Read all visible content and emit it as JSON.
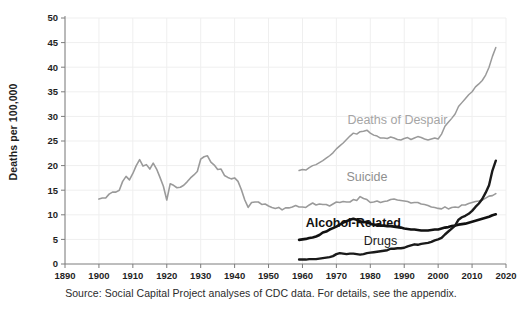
{
  "chart_data": {
    "type": "line",
    "title": "",
    "xlabel": "",
    "ylabel": "Deaths per 100,000",
    "xlim": [
      1890,
      2020
    ],
    "ylim": [
      0,
      50
    ],
    "grid": true,
    "legend_position": "inline-annotations",
    "xticks": [
      "1890",
      "1900",
      "1910",
      "1920",
      "1930",
      "1940",
      "1950",
      "1960",
      "1970",
      "1980",
      "1990",
      "2000",
      "2010",
      "2020"
    ],
    "yticks": [
      "0",
      "5",
      "10",
      "15",
      "20",
      "25",
      "30",
      "35",
      "40",
      "45",
      "50"
    ],
    "colors": {
      "deaths_of_despair": "#9a9a9a",
      "suicide": "#9a9a9a",
      "alcohol_related": "#111111",
      "drugs": "#1a1a1a",
      "axis": "#7c7c7c",
      "grid": "#efefef",
      "text": "#2b2b2b"
    },
    "series": [
      {
        "name": "Deaths of Despair",
        "color": "#9a9a9a",
        "label_x": 1988,
        "label_y": 28.5,
        "x": [
          1959,
          1960,
          1961,
          1962,
          1963,
          1964,
          1965,
          1966,
          1967,
          1968,
          1969,
          1970,
          1971,
          1972,
          1973,
          1974,
          1975,
          1976,
          1977,
          1978,
          1979,
          1980,
          1981,
          1982,
          1983,
          1984,
          1985,
          1986,
          1987,
          1988,
          1989,
          1990,
          1991,
          1992,
          1993,
          1994,
          1995,
          1996,
          1997,
          1998,
          1999,
          2000,
          2001,
          2002,
          2003,
          2004,
          2005,
          2006,
          2007,
          2008,
          2009,
          2010,
          2011,
          2012,
          2013,
          2014,
          2015,
          2016,
          2017
        ],
        "y": [
          19.0,
          19.2,
          19.1,
          19.6,
          20.0,
          20.2,
          20.6,
          21.0,
          21.5,
          22.0,
          22.6,
          23.4,
          24.0,
          24.6,
          25.3,
          26.0,
          26.6,
          26.4,
          26.9,
          27.0,
          27.2,
          26.6,
          26.2,
          26.0,
          25.6,
          25.6,
          25.5,
          25.8,
          25.6,
          25.3,
          25.2,
          25.5,
          25.7,
          25.3,
          25.6,
          25.9,
          25.7,
          25.4,
          25.2,
          25.4,
          25.6,
          25.4,
          26.4,
          28.0,
          28.8,
          29.6,
          30.5,
          32.0,
          32.8,
          33.6,
          34.4,
          35.0,
          36.0,
          36.6,
          37.3,
          38.4,
          40.0,
          42.2,
          44.0
        ]
      },
      {
        "name": "Suicide",
        "color": "#9a9a9a",
        "label_x": 1979,
        "label_y": 16.8,
        "x": [
          1900,
          1901,
          1902,
          1903,
          1904,
          1905,
          1906,
          1907,
          1908,
          1909,
          1910,
          1911,
          1912,
          1913,
          1914,
          1915,
          1916,
          1917,
          1918,
          1919,
          1920,
          1921,
          1922,
          1923,
          1924,
          1925,
          1926,
          1927,
          1928,
          1929,
          1930,
          1931,
          1932,
          1933,
          1934,
          1935,
          1936,
          1937,
          1938,
          1939,
          1940,
          1941,
          1942,
          1943,
          1944,
          1945,
          1946,
          1947,
          1948,
          1949,
          1950,
          1951,
          1952,
          1953,
          1954,
          1955,
          1956,
          1957,
          1958,
          1959,
          1960,
          1961,
          1962,
          1963,
          1964,
          1965,
          1966,
          1967,
          1968,
          1969,
          1970,
          1971,
          1972,
          1973,
          1974,
          1975,
          1976,
          1977,
          1978,
          1979,
          1980,
          1981,
          1982,
          1983,
          1984,
          1985,
          1986,
          1987,
          1988,
          1989,
          1990,
          1991,
          1992,
          1993,
          1994,
          1995,
          1996,
          1997,
          1998,
          1999,
          2000,
          2001,
          2002,
          2003,
          2004,
          2005,
          2006,
          2007,
          2008,
          2009,
          2010,
          2011,
          2012,
          2013,
          2014,
          2015,
          2016,
          2017
        ],
        "y": [
          13.2,
          13.4,
          13.4,
          14.2,
          14.6,
          14.6,
          15.0,
          16.8,
          17.8,
          17.1,
          18.4,
          20.0,
          21.2,
          19.9,
          20.2,
          19.3,
          20.5,
          19.3,
          17.6,
          15.8,
          13.0,
          16.3,
          16.0,
          15.5,
          15.6,
          16.0,
          16.7,
          17.5,
          18.1,
          18.8,
          21.3,
          21.8,
          22.0,
          20.7,
          20.1,
          19.2,
          19.3,
          18.0,
          17.6,
          17.3,
          17.5,
          16.8,
          15.1,
          13.0,
          11.5,
          12.5,
          12.6,
          12.6,
          12.1,
          12.2,
          11.8,
          11.5,
          11.3,
          11.5,
          11.0,
          11.4,
          11.4,
          11.6,
          11.9,
          11.6,
          11.6,
          11.5,
          12.0,
          12.4,
          12.0,
          12.2,
          12.1,
          12.1,
          11.8,
          12.2,
          12.6,
          12.5,
          12.7,
          12.6,
          12.6,
          13.1,
          12.9,
          13.7,
          13.3,
          13.1,
          12.5,
          12.6,
          12.8,
          12.5,
          12.7,
          12.8,
          13.1,
          13.2,
          13.0,
          12.9,
          12.8,
          12.7,
          12.4,
          12.5,
          12.5,
          12.2,
          12.1,
          11.9,
          11.6,
          11.5,
          11.3,
          11.2,
          11.6,
          11.2,
          11.5,
          11.6,
          11.5,
          12.0,
          12.0,
          12.3,
          12.5,
          12.7,
          12.8,
          13.0,
          13.4,
          13.8,
          13.9,
          14.3
        ]
      },
      {
        "name": "Alcohol-Related",
        "color": "#111111",
        "label_x": 1975,
        "label_y": 7.5,
        "x": [
          1959,
          1960,
          1961,
          1962,
          1963,
          1964,
          1965,
          1966,
          1967,
          1968,
          1969,
          1970,
          1971,
          1972,
          1973,
          1974,
          1975,
          1976,
          1977,
          1978,
          1979,
          1980,
          1981,
          1982,
          1983,
          1984,
          1985,
          1986,
          1987,
          1988,
          1989,
          1990,
          1991,
          1992,
          1993,
          1994,
          1995,
          1996,
          1997,
          1998,
          1999,
          2000,
          2001,
          2002,
          2003,
          2004,
          2005,
          2006,
          2007,
          2008,
          2009,
          2010,
          2011,
          2012,
          2013,
          2014,
          2015,
          2016,
          2017
        ],
        "y": [
          4.9,
          5.0,
          5.1,
          5.3,
          5.4,
          5.6,
          5.9,
          6.4,
          6.6,
          7.0,
          7.3,
          7.6,
          8.0,
          8.4,
          8.7,
          9.0,
          9.2,
          9.0,
          8.7,
          8.5,
          8.6,
          8.2,
          8.0,
          7.9,
          7.8,
          7.8,
          7.7,
          7.7,
          7.6,
          7.5,
          7.4,
          7.2,
          7.1,
          7.0,
          7.0,
          6.9,
          6.8,
          6.8,
          6.8,
          6.9,
          7.0,
          7.0,
          7.2,
          7.4,
          7.5,
          7.7,
          7.8,
          8.0,
          8.1,
          8.2,
          8.4,
          8.6,
          8.8,
          9.0,
          9.2,
          9.4,
          9.6,
          9.9,
          10.1
        ]
      },
      {
        "name": "Drugs",
        "color": "#1a1a1a",
        "label_x": 1983,
        "label_y": 3.9,
        "x": [
          1959,
          1960,
          1961,
          1962,
          1963,
          1964,
          1965,
          1966,
          1967,
          1968,
          1969,
          1970,
          1971,
          1972,
          1973,
          1974,
          1975,
          1976,
          1977,
          1978,
          1979,
          1980,
          1981,
          1982,
          1983,
          1984,
          1985,
          1986,
          1987,
          1988,
          1989,
          1990,
          1991,
          1992,
          1993,
          1994,
          1995,
          1996,
          1997,
          1998,
          1999,
          2000,
          2001,
          2002,
          2003,
          2004,
          2005,
          2006,
          2007,
          2008,
          2009,
          2010,
          2011,
          2012,
          2013,
          2014,
          2015,
          2016,
          2017
        ],
        "y": [
          0.9,
          0.9,
          0.9,
          1.0,
          1.0,
          1.0,
          1.1,
          1.2,
          1.3,
          1.4,
          1.6,
          2.0,
          2.2,
          2.1,
          2.0,
          2.1,
          2.1,
          2.0,
          1.9,
          2.0,
          2.2,
          2.3,
          2.4,
          2.5,
          2.6,
          2.7,
          2.8,
          3.1,
          3.1,
          3.2,
          3.2,
          3.3,
          3.6,
          3.8,
          4.0,
          3.9,
          4.1,
          4.2,
          4.3,
          4.5,
          4.8,
          5.0,
          5.3,
          6.0,
          6.6,
          7.2,
          7.8,
          9.0,
          9.5,
          9.8,
          10.2,
          10.8,
          11.6,
          12.3,
          13.2,
          14.5,
          16.0,
          19.0,
          21.0
        ]
      }
    ]
  },
  "caption": "Source: Social Capital Project analyses of CDC data. For details, see the appendix."
}
